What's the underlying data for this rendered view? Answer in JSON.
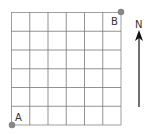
{
  "diagram": {
    "grid": {
      "rows": 6,
      "cols": 6,
      "line_color": "#777777"
    },
    "points": [
      {
        "id": "A",
        "label": "A",
        "position": "bottom-left",
        "color": "#888888"
      },
      {
        "id": "B",
        "label": "B",
        "position": "top-right",
        "color": "#888888"
      }
    ],
    "compass": {
      "label": "N",
      "icon": "north-arrow-icon"
    }
  }
}
